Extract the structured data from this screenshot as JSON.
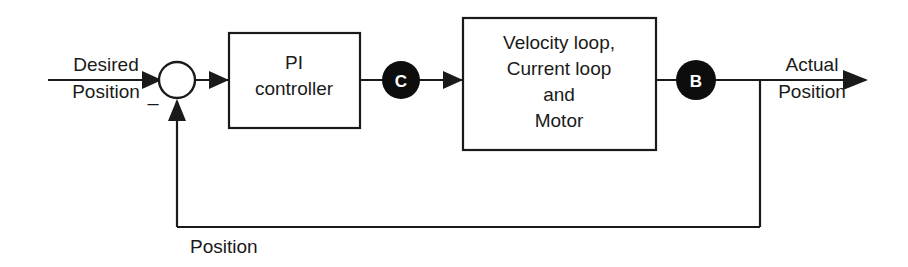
{
  "diagram": {
    "type": "control-system-block-diagram",
    "colors": {
      "line": "#1a1a1a",
      "block_fill": "#ffffff",
      "node_fill": "#0d0d0d",
      "node_text": "#ffffff",
      "background": "#ffffff"
    },
    "input": {
      "label_line1": "Desired",
      "label_line2": "Position"
    },
    "output": {
      "label_line1": "Actual",
      "label_line2": "Position"
    },
    "summing_junction": {
      "name": "summing-junction",
      "positive_sign": "",
      "negative_sign": "–"
    },
    "blocks": [
      {
        "id": "pi-controller",
        "lines": [
          "PI",
          "controller"
        ]
      },
      {
        "id": "plant",
        "lines": [
          "Velocity loop,",
          "Current loop",
          "and",
          "Motor"
        ]
      }
    ],
    "nodes": [
      {
        "id": "node-c",
        "label": "C"
      },
      {
        "id": "node-b",
        "label": "B"
      }
    ],
    "feedback": {
      "label": "Position"
    }
  }
}
